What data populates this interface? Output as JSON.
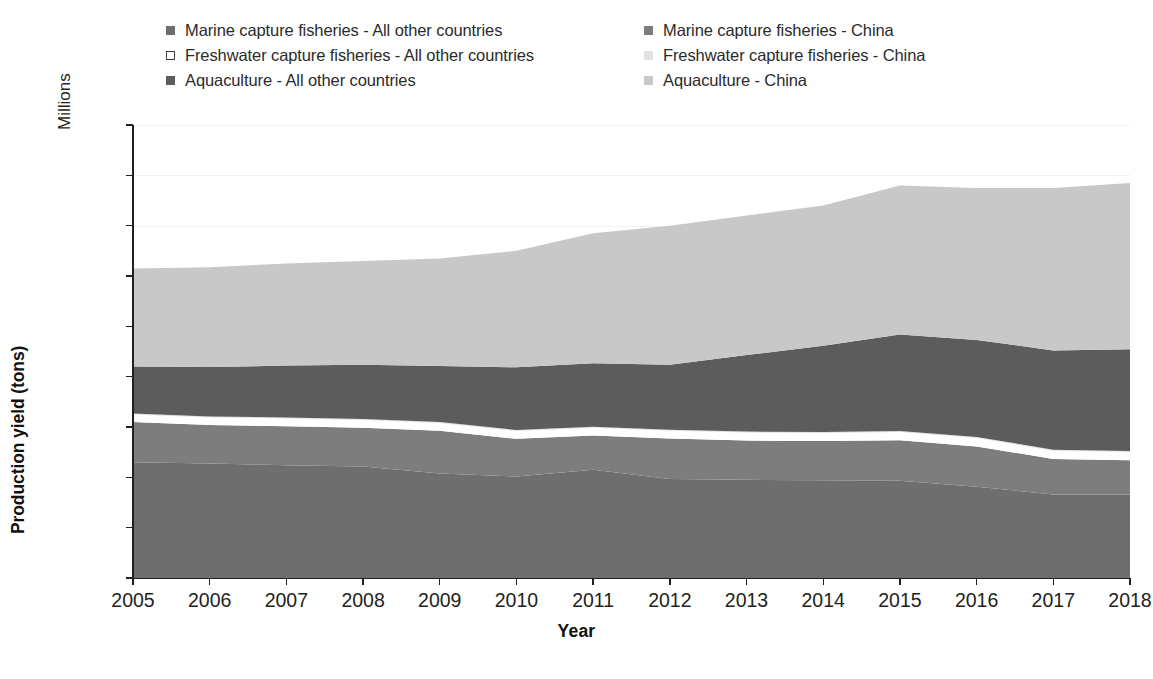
{
  "legend": {
    "columns": [
      {
        "items": [
          {
            "label": "Marine capture fisheries - All other countries",
            "swatch_color": "#6e6e6e",
            "swatch_name": "legend-swatch-marine-other"
          },
          {
            "label": "Freshwater capture fisheries - All other countries",
            "swatch_color": "#ffffff",
            "swatch_border": "#3a3a3a",
            "swatch_name": "legend-swatch-freshwater-other"
          },
          {
            "label": "Aquaculture - All other countries",
            "swatch_color": "#5c5c5c",
            "swatch_name": "legend-swatch-aquaculture-other"
          }
        ]
      },
      {
        "items": [
          {
            "label": "Marine capture fisheries - China",
            "swatch_color": "#7d7d7d",
            "swatch_name": "legend-swatch-marine-china"
          },
          {
            "label": "Freshwater capture fisheries - China",
            "swatch_color": "#e2e2e2",
            "swatch_name": "legend-swatch-freshwater-china"
          },
          {
            "label": "Aquaculture - China",
            "swatch_color": "#c8c8c8",
            "swatch_name": "legend-swatch-aquaculture-china"
          }
        ]
      }
    ]
  },
  "axes": {
    "y_title": "Production yield (tons)",
    "y_unit_label": "Millions",
    "x_title": "Year",
    "y_ticks": [
      "0",
      "20",
      "40",
      "60",
      "80",
      "100",
      "120",
      "140",
      "160",
      "180"
    ],
    "x_ticks": [
      "2005",
      "2006",
      "2007",
      "2008",
      "2009",
      "2010",
      "2011",
      "2012",
      "2013",
      "2014",
      "2015",
      "2016",
      "2017",
      "2018"
    ]
  },
  "chart_data": {
    "type": "area",
    "title": "",
    "subtitle": "",
    "xlabel": "Year",
    "ylabel": "Production yield (tons)",
    "y_unit": "Millions",
    "stacked": true,
    "grid": true,
    "legend_position": "top",
    "ylim": [
      0,
      180
    ],
    "ytick_step": 20,
    "x": [
      2005,
      2006,
      2007,
      2008,
      2009,
      2010,
      2011,
      2012,
      2013,
      2014,
      2015,
      2016,
      2017,
      2018
    ],
    "categories": [
      "2005",
      "2006",
      "2007",
      "2008",
      "2009",
      "2010",
      "2011",
      "2012",
      "2013",
      "2014",
      "2015",
      "2016",
      "2017",
      "2018"
    ],
    "series": [
      {
        "name": "Marine capture fisheries - All other countries",
        "color": "#6e6e6e",
        "values": [
          46.0,
          45.5,
          44.8,
          44.3,
          41.5,
          40.3,
          43.0,
          39.3,
          39.0,
          38.8,
          38.6,
          36.3,
          33.2,
          33.2
        ]
      },
      {
        "name": "Marine capture fisheries - China",
        "color": "#7d7d7d",
        "values": [
          16.0,
          15.3,
          15.5,
          15.4,
          17.0,
          15.0,
          13.6,
          16.1,
          15.6,
          15.6,
          16.1,
          16.0,
          14.1,
          13.6
        ]
      },
      {
        "name": "Freshwater capture fisheries - All other countries",
        "color": "#ffffff",
        "values": [
          3.0,
          3.0,
          3.1,
          3.1,
          3.1,
          3.1,
          3.1,
          3.1,
          3.2,
          3.2,
          3.3,
          3.3,
          3.3,
          3.3
        ]
      },
      {
        "name": "Freshwater capture fisheries - China",
        "color": "#e2e2e2",
        "values": [
          0.4,
          0.4,
          0.4,
          0.4,
          0.4,
          0.4,
          0.4,
          0.4,
          0.4,
          0.4,
          0.4,
          0.4,
          0.4,
          0.4
        ]
      },
      {
        "name": "Aquaculture - All other countries",
        "color": "#5c5c5c",
        "values": [
          18.6,
          19.6,
          20.6,
          21.5,
          22.2,
          24.9,
          25.2,
          25.8,
          30.4,
          34.3,
          38.4,
          38.6,
          39.4,
          40.4
        ]
      },
      {
        "name": "Aquaculture - China",
        "color": "#c8c8c8",
        "values": [
          39.0,
          39.7,
          40.6,
          41.3,
          42.8,
          46.3,
          51.7,
          55.3,
          55.4,
          55.7,
          59.2,
          60.4,
          64.6,
          66.1
        ]
      }
    ],
    "totals": [
      123.0,
      123.5,
      125.0,
      126.0,
      127.0,
      130.0,
      137.0,
      140.0,
      144.0,
      148.0,
      156.0,
      155.0,
      155.0,
      157.0
    ]
  }
}
